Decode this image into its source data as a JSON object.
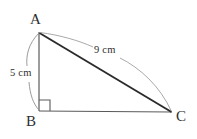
{
  "figure": {
    "type": "geometry-diagram",
    "shape": "right-triangle",
    "background_color": "#ffffff",
    "stroke_color": "#4a4a4a",
    "hypotenuse_color": "#2b2b2b",
    "arc_color": "#8a8a8a",
    "text_color": "#2e2e2e",
    "vertices": [
      {
        "name": "vertex-a",
        "label": "A",
        "x": 39,
        "y": 32
      },
      {
        "name": "vertex-b",
        "label": "B",
        "x": 39,
        "y": 111
      },
      {
        "name": "vertex-c",
        "label": "C",
        "x": 172,
        "y": 112
      }
    ],
    "right_angle_at": "B",
    "right_angle_marker": {
      "name": "right-angle-square",
      "size": 11
    },
    "sides": [
      {
        "name": "side-ab",
        "from": "A",
        "to": "B",
        "measure_label": "5 cm",
        "value": 5,
        "unit": "cm"
      },
      {
        "name": "side-ac",
        "from": "A",
        "to": "C",
        "measure_label": "9 cm",
        "value": 9,
        "unit": "cm"
      },
      {
        "name": "side-bc",
        "from": "B",
        "to": "C",
        "measure_label": "",
        "value": null,
        "unit": "cm"
      }
    ]
  }
}
